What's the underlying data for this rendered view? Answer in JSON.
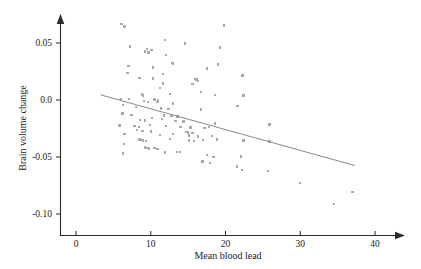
{
  "figure": {
    "background_color": "#ffffff",
    "point_color": "#a9a9a9",
    "line_color": "#8a8a8a",
    "axis_color": "#2b2b2b"
  },
  "chart_data": {
    "type": "scatter",
    "title": "",
    "subtitle": "",
    "xlabel": "Mean blood lead",
    "ylabel": "Brain volume change",
    "xlim": [
      0,
      42.5
    ],
    "ylim": [
      -0.113,
      0.072
    ],
    "xticks": [
      0,
      10,
      20,
      30,
      40
    ],
    "xticklabels": [
      "0",
      "10",
      "20",
      "30",
      "40"
    ],
    "yticks": [
      0.05,
      0.0,
      -0.05,
      -0.1
    ],
    "yticklabels": [
      "0.05",
      "0.0",
      "-0.05",
      "-0.10"
    ],
    "grid": false,
    "legend": null,
    "annotations": [],
    "series": [
      {
        "name": "observations",
        "marker": "square",
        "marker_size_px": 2.4,
        "color": "#a9a9a9",
        "points": [
          [
            6.1,
            0.0665
          ],
          [
            6.5,
            0.0645
          ],
          [
            19.8,
            0.0655
          ],
          [
            11.9,
            0.0525
          ],
          [
            14.6,
            0.0495
          ],
          [
            19.3,
            0.046
          ],
          [
            7.2,
            0.047
          ],
          [
            9.5,
            0.0445
          ],
          [
            10.1,
            0.044
          ],
          [
            9.2,
            0.0425
          ],
          [
            9.7,
            0.0415
          ],
          [
            12.0,
            0.0395
          ],
          [
            12.9,
            0.0325
          ],
          [
            13.0,
            0.032
          ],
          [
            19.0,
            0.031
          ],
          [
            7.0,
            0.03
          ],
          [
            10.3,
            0.0285
          ],
          [
            17.5,
            0.0275
          ],
          [
            6.9,
            0.0235
          ],
          [
            11.6,
            0.023
          ],
          [
            22.3,
            0.0215
          ],
          [
            8.5,
            0.0195
          ],
          [
            10.3,
            0.019
          ],
          [
            15.9,
            0.0185
          ],
          [
            16.1,
            0.018
          ],
          [
            16.3,
            0.0165
          ],
          [
            11.6,
            0.0145
          ],
          [
            15.6,
            0.014
          ],
          [
            11.2,
            0.0105
          ],
          [
            16.7,
            0.007
          ],
          [
            12.6,
            0.0055
          ],
          [
            8.8,
            0.005
          ],
          [
            9.0,
            0.004
          ],
          [
            18.6,
            0.0045
          ],
          [
            22.4,
            0.004
          ],
          [
            6.0,
            0.001
          ],
          [
            7.1,
            0.0008
          ],
          [
            10.5,
            0.0005
          ],
          [
            11.0,
            -0.0005
          ],
          [
            9.1,
            -0.001
          ],
          [
            9.6,
            -0.0015
          ],
          [
            10.9,
            -0.002
          ],
          [
            13.0,
            -0.003
          ],
          [
            6.3,
            -0.0045
          ],
          [
            8.0,
            -0.006
          ],
          [
            11.4,
            -0.0075
          ],
          [
            12.4,
            -0.008
          ],
          [
            16.7,
            -0.0085
          ],
          [
            21.6,
            -0.0055
          ],
          [
            6.2,
            -0.012
          ],
          [
            7.4,
            -0.013
          ],
          [
            11.8,
            -0.0135
          ],
          [
            12.8,
            -0.014
          ],
          [
            13.6,
            -0.0145
          ],
          [
            10.2,
            -0.016
          ],
          [
            11.5,
            -0.0165
          ],
          [
            8.6,
            -0.0175
          ],
          [
            9.2,
            -0.018
          ],
          [
            13.3,
            -0.0185
          ],
          [
            14.4,
            -0.019
          ],
          [
            18.6,
            -0.0205
          ],
          [
            25.9,
            -0.0215
          ],
          [
            5.8,
            -0.0225
          ],
          [
            7.8,
            -0.023
          ],
          [
            8.4,
            -0.0235
          ],
          [
            9.9,
            -0.022
          ],
          [
            12.0,
            -0.023
          ],
          [
            14.0,
            -0.0235
          ],
          [
            15.3,
            -0.024
          ],
          [
            17.2,
            -0.0245
          ],
          [
            17.8,
            -0.0235
          ],
          [
            8.2,
            -0.0265
          ],
          [
            8.9,
            -0.027
          ],
          [
            10.0,
            -0.0275
          ],
          [
            14.8,
            -0.028
          ],
          [
            15.0,
            -0.0285
          ],
          [
            15.6,
            -0.029
          ],
          [
            6.5,
            -0.03
          ],
          [
            11.2,
            -0.0305
          ],
          [
            13.0,
            -0.03
          ],
          [
            15.1,
            -0.031
          ],
          [
            16.3,
            -0.032
          ],
          [
            18.2,
            -0.0315
          ],
          [
            8.5,
            -0.0345
          ],
          [
            8.7,
            -0.035
          ],
          [
            9.0,
            -0.0355
          ],
          [
            9.4,
            -0.036
          ],
          [
            12.6,
            -0.034
          ],
          [
            15.1,
            -0.0355
          ],
          [
            15.8,
            -0.036
          ],
          [
            17.0,
            -0.035
          ],
          [
            18.9,
            -0.0345
          ],
          [
            22.4,
            -0.0355
          ],
          [
            25.9,
            -0.0365
          ],
          [
            6.4,
            -0.0385
          ],
          [
            9.2,
            -0.0415
          ],
          [
            9.5,
            -0.042
          ],
          [
            9.8,
            -0.0425
          ],
          [
            10.5,
            -0.042
          ],
          [
            10.9,
            -0.043
          ],
          [
            13.5,
            -0.0455
          ],
          [
            13.9,
            -0.0455
          ],
          [
            11.9,
            -0.046
          ],
          [
            6.3,
            -0.047
          ],
          [
            17.5,
            -0.0485
          ],
          [
            18.4,
            -0.05
          ],
          [
            22.1,
            -0.0495
          ],
          [
            16.9,
            -0.054
          ],
          [
            17.9,
            -0.055
          ],
          [
            21.5,
            -0.0585
          ],
          [
            22.2,
            -0.0615
          ],
          [
            25.7,
            -0.0625
          ],
          [
            30.0,
            -0.073
          ],
          [
            34.5,
            -0.091
          ],
          [
            37.0,
            -0.0805
          ]
        ]
      }
    ],
    "fit_line": {
      "name": "regression-line",
      "color": "#8a8a8a",
      "x_start": 3.3,
      "y_start": 0.0045,
      "x_end": 37.3,
      "y_end": -0.0575
    }
  }
}
